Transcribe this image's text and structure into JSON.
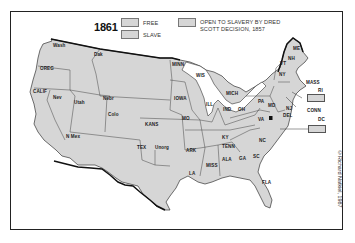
{
  "legend": {
    "year": "1861",
    "items": [
      {
        "label": "FREE",
        "color": "#d6d6d6"
      },
      {
        "label": "SLAVE",
        "color": "#d6d6d6"
      },
      {
        "label_line1": "OPEN TO SLAVERY BY DRED",
        "label_line2": "SCOTT DECISION, 1857",
        "color": "#d6d6d6"
      }
    ]
  },
  "states": {
    "wash": "Wash",
    "oreg": "OREG",
    "calif": "CALIF",
    "nev": "Nev",
    "utah": "Utah",
    "dak": "Dak",
    "nebr": "Nebr",
    "colo": "Colo",
    "nmex": "N Mex",
    "kans": "KANS",
    "tex": "TEX",
    "unorg": "Unorg",
    "minn": "MINN",
    "iowa": "IOWA",
    "mo": "MO",
    "ark": "ARK",
    "la": "LA",
    "wis": "WIS",
    "ill": "ILL",
    "mich": "MICH",
    "ind": "IND",
    "oh": "OH",
    "ky": "KY",
    "tenn": "TENN",
    "miss": "MISS",
    "ala": "ALA",
    "ga": "GA",
    "sc": "SC",
    "nc": "NC",
    "fla": "FLA",
    "va": "VA",
    "md": "MD",
    "del": "DEL",
    "pa": "PA",
    "nj": "NJ",
    "ny": "NY",
    "vt": "VT",
    "nh": "NH",
    "me": "ME",
    "mass": "MASS",
    "ri": "RI",
    "conn": "CONN",
    "dc": "DC"
  },
  "credit": "©Richard Natkiel, 1987",
  "colors": {
    "land": "#d6d6d6",
    "border": "#333333",
    "frame": "#222222"
  }
}
